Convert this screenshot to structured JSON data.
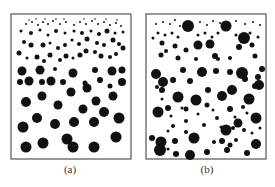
{
  "figure": {
    "panels": [
      {
        "id": "a",
        "caption": "(a)",
        "frame": {
          "x": 11,
          "y": 14,
          "w": 120,
          "h": 145
        },
        "dots": [
          [
            26,
            102,
            5
          ],
          [
            42,
            96,
            4.5
          ],
          [
            58,
            105,
            4.5
          ],
          [
            71,
            92,
            4.5
          ],
          [
            87,
            88,
            4.5
          ],
          [
            96,
            101,
            4.5
          ],
          [
            113,
            96,
            4.5
          ],
          [
            122,
            82,
            4
          ],
          [
            37,
            118,
            5
          ],
          [
            23,
            127,
            5.5
          ],
          [
            55,
            124,
            5
          ],
          [
            74,
            122,
            5
          ],
          [
            83,
            109,
            4.5
          ],
          [
            94,
            122,
            5
          ],
          [
            104,
            112,
            5
          ],
          [
            119,
            118,
            5.5
          ],
          [
            26,
            147,
            5.5
          ],
          [
            43,
            143,
            5.5
          ],
          [
            67,
            139,
            5.5
          ],
          [
            73,
            147,
            5.5
          ],
          [
            94,
            147,
            5.5
          ],
          [
            116,
            137,
            5.5
          ],
          [
            22,
            71,
            4.5
          ],
          [
            40,
            70,
            4.5
          ],
          [
            73,
            73,
            4.5
          ],
          [
            95,
            70,
            3
          ],
          [
            112,
            71,
            4.5
          ],
          [
            122,
            70,
            3.5
          ],
          [
            55,
            69,
            2
          ],
          [
            20,
            82,
            3
          ],
          [
            29,
            81,
            4.5
          ],
          [
            42,
            82,
            3
          ],
          [
            51,
            81,
            4.5
          ],
          [
            63,
            82,
            3
          ],
          [
            85,
            83,
            2.5
          ],
          [
            100,
            80,
            3
          ],
          [
            110,
            86,
            2.5
          ],
          [
            19,
            53,
            2.5
          ],
          [
            27,
            58,
            1.5
          ],
          [
            37,
            57,
            2.5
          ],
          [
            44,
            61,
            2
          ],
          [
            50,
            55,
            2.5
          ],
          [
            60,
            60,
            2
          ],
          [
            66,
            56,
            2.5
          ],
          [
            73,
            58,
            1.5
          ],
          [
            80,
            55,
            2.5
          ],
          [
            86,
            51,
            2.5
          ],
          [
            95,
            52,
            2
          ],
          [
            101,
            56,
            2.5
          ],
          [
            110,
            57,
            2
          ],
          [
            116,
            54,
            2
          ],
          [
            123,
            48,
            2.5
          ],
          [
            24,
            42,
            2
          ],
          [
            31,
            45,
            2.5
          ],
          [
            43,
            45,
            2.5
          ],
          [
            50,
            43,
            1.5
          ],
          [
            58,
            48,
            2
          ],
          [
            65,
            45,
            2
          ],
          [
            72,
            40,
            1.5
          ],
          [
            79,
            44,
            2
          ],
          [
            87,
            39,
            2.5
          ],
          [
            97,
            43,
            2
          ],
          [
            104,
            45,
            2
          ],
          [
            113,
            40,
            2.5
          ],
          [
            119,
            44,
            2
          ],
          [
            21,
            31,
            1.5
          ],
          [
            31,
            33,
            2
          ],
          [
            40,
            30,
            1.5
          ],
          [
            48,
            35,
            1.5
          ],
          [
            56,
            31,
            2
          ],
          [
            65,
            33,
            1.5
          ],
          [
            74,
            31,
            1.5
          ],
          [
            82,
            33,
            2
          ],
          [
            91,
            31,
            1.5
          ],
          [
            99,
            34,
            2
          ],
          [
            107,
            31,
            2.5
          ],
          [
            115,
            33,
            1.5
          ],
          [
            123,
            32,
            1.5
          ],
          [
            26,
            24,
            1
          ],
          [
            32,
            22,
            1
          ],
          [
            38,
            25,
            1
          ],
          [
            43,
            22,
            1
          ],
          [
            48,
            24,
            1
          ],
          [
            53,
            21,
            1
          ],
          [
            60,
            24,
            1
          ],
          [
            66,
            22,
            1
          ],
          [
            74,
            25,
            1
          ],
          [
            80,
            22,
            1
          ],
          [
            86,
            24,
            1
          ],
          [
            92,
            21,
            1
          ],
          [
            98,
            24,
            1
          ],
          [
            104,
            22,
            1
          ],
          [
            110,
            25,
            1
          ],
          [
            116,
            23,
            1
          ],
          [
            121,
            26,
            1
          ],
          [
            29,
            20,
            0.8
          ],
          [
            36,
            19,
            0.8
          ],
          [
            45,
            19,
            0.8
          ],
          [
            56,
            19,
            0.8
          ],
          [
            64,
            19,
            0.8
          ],
          [
            84,
            19,
            0.8
          ],
          [
            95,
            19,
            0.8
          ],
          [
            106,
            19,
            0.8
          ],
          [
            117,
            20,
            0.8
          ]
        ]
      },
      {
        "id": "b",
        "caption": "(b)",
        "frame": {
          "x": 146,
          "y": 14,
          "w": 120,
          "h": 145
        },
        "dots": [
          [
            188,
            26,
            6
          ],
          [
            226,
            26,
            5.5
          ],
          [
            244,
            38,
            6
          ],
          [
            210,
            44,
            4.5
          ],
          [
            198,
            45,
            4.5
          ],
          [
            162,
            43,
            2.5
          ],
          [
            166,
            51,
            2
          ],
          [
            175,
            46,
            2.5
          ],
          [
            186,
            50,
            2.5
          ],
          [
            215,
            56,
            3
          ],
          [
            239,
            47,
            3
          ],
          [
            252,
            45,
            2.5
          ],
          [
            161,
            55,
            2.5
          ],
          [
            178,
            58,
            2.5
          ],
          [
            196,
            59,
            2
          ],
          [
            218,
            59,
            2
          ],
          [
            230,
            58,
            2
          ],
          [
            255,
            56,
            2.5
          ],
          [
            156,
            74,
            5
          ],
          [
            163,
            82,
            5
          ],
          [
            183,
            70,
            3
          ],
          [
            202,
            72,
            5
          ],
          [
            216,
            71,
            3
          ],
          [
            230,
            72,
            3
          ],
          [
            242,
            73,
            6
          ],
          [
            258,
            77,
            3
          ],
          [
            262,
            69,
            3
          ],
          [
            173,
            80,
            3
          ],
          [
            190,
            81,
            3
          ],
          [
            208,
            90,
            3
          ],
          [
            232,
            90,
            5
          ],
          [
            245,
            79,
            3
          ],
          [
            259,
            85,
            5
          ],
          [
            158,
            112,
            5.5
          ],
          [
            178,
            97,
            5.5
          ],
          [
            196,
            100,
            5.5
          ],
          [
            222,
            96,
            5
          ],
          [
            249,
            99,
            5.5
          ],
          [
            255,
            86,
            3
          ],
          [
            168,
            108,
            3
          ],
          [
            186,
            109,
            2.5
          ],
          [
            207,
            105,
            2.5
          ],
          [
            230,
            109,
            3
          ],
          [
            243,
            107,
            2
          ],
          [
            161,
            142,
            5.5
          ],
          [
            194,
            138,
            5.5
          ],
          [
            226,
            130,
            5.5
          ],
          [
            256,
            144,
            5
          ],
          [
            238,
            123,
            4.5
          ],
          [
            256,
            118,
            5.5
          ],
          [
            152,
            138,
            3
          ],
          [
            175,
            141,
            3
          ],
          [
            190,
            155,
            5
          ],
          [
            207,
            152,
            3
          ],
          [
            227,
            150,
            3
          ],
          [
            247,
            153,
            3
          ],
          [
            176,
            154,
            3
          ],
          [
            222,
            141,
            3
          ],
          [
            160,
            150,
            6
          ],
          [
            162,
            90,
            3
          ],
          [
            157,
            87,
            2
          ],
          [
            153,
            38,
            1.5
          ],
          [
            158,
            33,
            1.5
          ],
          [
            165,
            35,
            1.5
          ],
          [
            172,
            33,
            1.5
          ],
          [
            178,
            37,
            1.5
          ],
          [
            198,
            35,
            1.5
          ],
          [
            205,
            33,
            1.5
          ],
          [
            212,
            37,
            1.5
          ],
          [
            218,
            33,
            1.5
          ],
          [
            236,
            35,
            1.5
          ],
          [
            250,
            33,
            1.5
          ],
          [
            258,
            37,
            1.5
          ],
          [
            156,
            24,
            1
          ],
          [
            163,
            22,
            1
          ],
          [
            170,
            24,
            1
          ],
          [
            175,
            20,
            1
          ],
          [
            180,
            26,
            1
          ],
          [
            200,
            22,
            1
          ],
          [
            207,
            25,
            1
          ],
          [
            213,
            21,
            1
          ],
          [
            220,
            23,
            1
          ],
          [
            236,
            21,
            1
          ],
          [
            245,
            24,
            1
          ],
          [
            253,
            22,
            1
          ],
          [
            260,
            25,
            1
          ],
          [
            182,
            108,
            1.5
          ],
          [
            198,
            114,
            1.5
          ],
          [
            213,
            110,
            1.5
          ],
          [
            217,
            118,
            2
          ],
          [
            235,
            117,
            1.5
          ],
          [
            247,
            113,
            1.5
          ],
          [
            221,
            127,
            1.5
          ],
          [
            204,
            125,
            2
          ],
          [
            186,
            121,
            2
          ],
          [
            173,
            126,
            2
          ],
          [
            168,
            131,
            1.5
          ],
          [
            186,
            132,
            2
          ],
          [
            233,
            128,
            2
          ],
          [
            244,
            130,
            2
          ],
          [
            252,
            133,
            1.5
          ],
          [
            214,
            142,
            2
          ],
          [
            236,
            140,
            2
          ],
          [
            230,
            145,
            2.5
          ],
          [
            168,
            149,
            1.5
          ],
          [
            260,
            128,
            1.5
          ],
          [
            162,
            99,
            1.5
          ],
          [
            171,
            116,
            1.5
          ]
        ]
      }
    ]
  }
}
